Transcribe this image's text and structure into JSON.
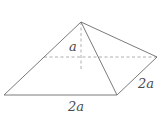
{
  "figure": {
    "labels": {
      "height": "a",
      "base_front": "2a",
      "base_side": "2a"
    },
    "colors": {
      "edge": "#6b6b6b",
      "hidden_edge": "#9a9a9a",
      "label": "#4a4a4a",
      "background": "#ffffff"
    }
  }
}
